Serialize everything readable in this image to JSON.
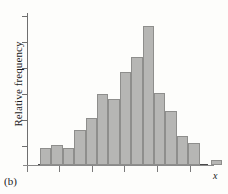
{
  "figure": {
    "panel_label": "(b)",
    "xlabel": "x",
    "ylabel": "Relative frequency",
    "bar_fill_color": "#b6b6b4",
    "bar_edge_color": "#8e8e8c",
    "axis_color": "#6f6f6f"
  },
  "chart_data": {
    "type": "bar",
    "title": "",
    "subtitle": "",
    "xlabel": "x",
    "ylabel": "Relative frequency",
    "grid": false,
    "legend": "none",
    "axis_tick_labels_shown": false,
    "n_bins": 15,
    "bin_width_px": 11.4,
    "baseline_y_px": 165,
    "y_axis_x_px": 27,
    "x_tick_positions_px": [
      27,
      59,
      92,
      124,
      157,
      190
    ],
    "y_tick_positions_px": [
      16,
      42,
      68,
      94,
      120,
      146
    ],
    "categories": [
      "b1",
      "b2",
      "b3",
      "b4",
      "b5",
      "b6",
      "b7",
      "b8",
      "b9",
      "b10",
      "b11",
      "b12",
      "b13",
      "b14",
      "b15"
    ],
    "values": [
      0.115,
      0.135,
      0.115,
      0.235,
      0.315,
      0.475,
      0.44,
      0.62,
      0.72,
      0.93,
      0.48,
      0.365,
      0.195,
      0.15,
      0.035
    ],
    "ylim": [
      0,
      1.0
    ],
    "bars_px": [
      {
        "name": "b1",
        "x": 40.0,
        "w": 11.4,
        "top": 148,
        "height": 17
      },
      {
        "name": "b2",
        "x": 51.4,
        "w": 11.4,
        "top": 145,
        "height": 20
      },
      {
        "name": "b3",
        "x": 62.8,
        "w": 11.4,
        "top": 148,
        "height": 17
      },
      {
        "name": "b4",
        "x": 74.2,
        "w": 11.4,
        "top": 130,
        "height": 35
      },
      {
        "name": "b5",
        "x": 85.6,
        "w": 11.4,
        "top": 118,
        "height": 47
      },
      {
        "name": "b6",
        "x": 97.0,
        "w": 11.4,
        "top": 94,
        "height": 71
      },
      {
        "name": "b7",
        "x": 108.4,
        "w": 11.4,
        "top": 99,
        "height": 66
      },
      {
        "name": "b8",
        "x": 119.8,
        "w": 11.4,
        "top": 72,
        "height": 93
      },
      {
        "name": "b9",
        "x": 131.2,
        "w": 11.4,
        "top": 57,
        "height": 108
      },
      {
        "name": "b10",
        "x": 142.6,
        "w": 11.4,
        "top": 26,
        "height": 139
      },
      {
        "name": "b11",
        "x": 154.0,
        "w": 11.4,
        "top": 93,
        "height": 72
      },
      {
        "name": "b12",
        "x": 165.4,
        "w": 11.4,
        "top": 111,
        "height": 54
      },
      {
        "name": "b13",
        "x": 176.8,
        "w": 11.4,
        "top": 136,
        "height": 29
      },
      {
        "name": "b14",
        "x": 188.2,
        "w": 11.4,
        "top": 143,
        "height": 22
      },
      {
        "name": "b15",
        "x": 211.0,
        "w": 11.4,
        "top": 160,
        "height": 5
      }
    ]
  }
}
